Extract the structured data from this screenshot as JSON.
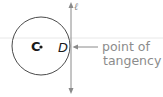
{
  "diagram": {
    "circle": {
      "center_label": "C",
      "cx": 41,
      "cy": 46,
      "r": 29,
      "stroke": "#4a4a4a"
    },
    "tangent_line": {
      "label": "ℓ",
      "x": 71,
      "y1": 3,
      "y2": 93,
      "stroke": "#8a8a8a"
    },
    "tangency_point": {
      "label": "D"
    },
    "annotation": {
      "line1": "point of",
      "line2": "tangency",
      "color": "#8c8c8c"
    },
    "background_rule": {
      "y": 38,
      "color": "#e6e6e6"
    }
  }
}
